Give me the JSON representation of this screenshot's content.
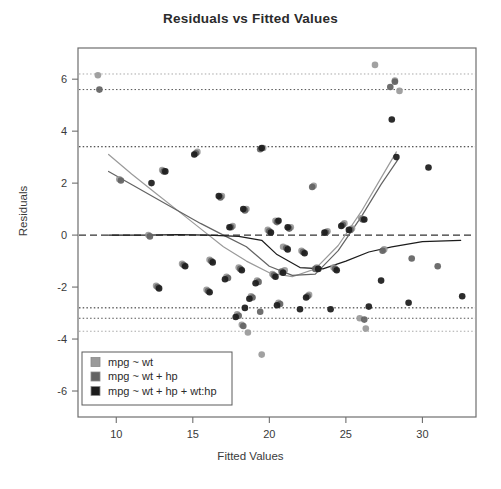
{
  "chart_data": {
    "type": "scatter",
    "title": "Residuals vs Fitted Values",
    "xlabel": "Fitted Values",
    "ylabel": "Residuals",
    "xlim": [
      7.5,
      33.5
    ],
    "ylim": [
      -7.0,
      7.2
    ],
    "xticks": [
      10,
      15,
      20,
      25,
      30
    ],
    "yticks": [
      -6,
      -4,
      -2,
      0,
      2,
      4,
      6
    ],
    "grid": false,
    "legend_position": "bottom-left",
    "zero_line": {
      "y": 0,
      "style": "dashed",
      "color": "#333333"
    },
    "reference_lines": [
      {
        "y": 6.2,
        "style": "dotted",
        "color": "#a8a8a8",
        "series": "mpg ~ wt"
      },
      {
        "y": 5.6,
        "style": "dotted",
        "color": "#555555",
        "series": "mpg ~ wt + hp"
      },
      {
        "y": 3.4,
        "style": "dotted",
        "color": "#222222",
        "series": "mpg ~ wt + hp + wt:hp"
      },
      {
        "y": -2.8,
        "style": "dotted",
        "color": "#222222",
        "series": "mpg ~ wt + hp + wt:hp"
      },
      {
        "y": -3.2,
        "style": "dotted",
        "color": "#555555",
        "series": "mpg ~ wt + hp"
      },
      {
        "y": -3.7,
        "style": "dotted",
        "color": "#a8a8a8",
        "series": "mpg ~ wt"
      }
    ],
    "series": [
      {
        "name": "mpg ~ wt",
        "color": "#9a9a9a",
        "points": [
          [
            8.8,
            6.15
          ],
          [
            26.9,
            6.55
          ],
          [
            28.2,
            5.95
          ],
          [
            28.5,
            5.55
          ],
          [
            19.6,
            3.35
          ],
          [
            15.3,
            3.2
          ],
          [
            10.2,
            2.15
          ],
          [
            22.9,
            1.9
          ],
          [
            13.0,
            2.5
          ],
          [
            16.9,
            1.5
          ],
          [
            18.5,
            1.0
          ],
          [
            20.4,
            0.55
          ],
          [
            21.4,
            0.3
          ],
          [
            23.8,
            0.15
          ],
          [
            25.4,
            0.25
          ],
          [
            26.0,
            0.65
          ],
          [
            12.1,
            0.0
          ],
          [
            24.9,
            0.45
          ],
          [
            17.6,
            0.35
          ],
          [
            19.9,
            0.2
          ],
          [
            20.9,
            -0.45
          ],
          [
            22.1,
            -0.6
          ],
          [
            16.1,
            -0.95
          ],
          [
            18.0,
            -1.25
          ],
          [
            21.0,
            -1.35
          ],
          [
            23.1,
            -1.25
          ],
          [
            17.2,
            -1.6
          ],
          [
            19.2,
            -1.75
          ],
          [
            20.2,
            -1.5
          ],
          [
            24.2,
            -1.25
          ],
          [
            27.5,
            -0.55
          ],
          [
            15.9,
            -2.1
          ],
          [
            18.8,
            -2.35
          ],
          [
            20.6,
            -2.6
          ],
          [
            22.6,
            -2.3
          ],
          [
            17.9,
            -3.05
          ],
          [
            18.2,
            -3.45
          ],
          [
            18.6,
            -3.75
          ],
          [
            19.5,
            -4.6
          ],
          [
            26.3,
            -3.6
          ],
          [
            25.9,
            -3.2
          ],
          [
            12.6,
            -1.95
          ],
          [
            14.3,
            -1.1
          ]
        ]
      },
      {
        "name": "mpg ~ wt + hp",
        "color": "#636363",
        "points": [
          [
            8.9,
            5.6
          ],
          [
            28.2,
            5.9
          ],
          [
            27.9,
            5.7
          ],
          [
            19.4,
            3.3
          ],
          [
            15.2,
            3.15
          ],
          [
            10.3,
            2.1
          ],
          [
            22.8,
            1.85
          ],
          [
            13.1,
            2.45
          ],
          [
            16.8,
            1.45
          ],
          [
            18.4,
            0.95
          ],
          [
            20.5,
            0.5
          ],
          [
            21.3,
            0.25
          ],
          [
            23.7,
            0.1
          ],
          [
            25.3,
            0.2
          ],
          [
            26.1,
            0.6
          ],
          [
            12.2,
            -0.05
          ],
          [
            24.8,
            0.4
          ],
          [
            17.5,
            0.3
          ],
          [
            20.0,
            0.15
          ],
          [
            21.1,
            -0.5
          ],
          [
            22.2,
            -0.65
          ],
          [
            16.2,
            -1.0
          ],
          [
            18.1,
            -1.3
          ],
          [
            20.8,
            -1.4
          ],
          [
            23.0,
            -1.3
          ],
          [
            17.3,
            -1.65
          ],
          [
            19.3,
            -1.8
          ],
          [
            20.3,
            -1.55
          ],
          [
            24.3,
            -1.3
          ],
          [
            27.4,
            -0.6
          ],
          [
            16.0,
            -2.15
          ],
          [
            18.9,
            -2.4
          ],
          [
            20.7,
            -2.65
          ],
          [
            22.5,
            -2.35
          ],
          [
            18.0,
            -3.1
          ],
          [
            18.3,
            -3.5
          ],
          [
            19.4,
            -2.95
          ],
          [
            26.2,
            -3.25
          ],
          [
            12.7,
            -2.0
          ],
          [
            14.4,
            -1.15
          ],
          [
            29.3,
            -0.9
          ],
          [
            31.0,
            -1.2
          ]
        ]
      },
      {
        "name": "mpg ~ wt + hp + wt:hp",
        "color": "#1c1c1c",
        "points": [
          [
            28.0,
            4.45
          ],
          [
            28.3,
            3.0
          ],
          [
            30.4,
            2.6
          ],
          [
            19.5,
            3.35
          ],
          [
            15.1,
            3.1
          ],
          [
            13.2,
            2.45
          ],
          [
            12.3,
            2.0
          ],
          [
            16.7,
            1.5
          ],
          [
            18.3,
            1.0
          ],
          [
            20.6,
            0.55
          ],
          [
            21.2,
            0.3
          ],
          [
            23.6,
            0.1
          ],
          [
            25.2,
            0.2
          ],
          [
            26.2,
            0.6
          ],
          [
            24.7,
            0.35
          ],
          [
            17.4,
            0.3
          ],
          [
            20.1,
            0.1
          ],
          [
            21.2,
            -0.55
          ],
          [
            22.3,
            -0.7
          ],
          [
            16.3,
            -1.05
          ],
          [
            18.2,
            -1.35
          ],
          [
            20.9,
            -1.45
          ],
          [
            23.2,
            -1.3
          ],
          [
            17.1,
            -1.7
          ],
          [
            19.1,
            -1.85
          ],
          [
            20.4,
            -1.6
          ],
          [
            24.4,
            -1.35
          ],
          [
            27.3,
            -1.75
          ],
          [
            16.1,
            -2.2
          ],
          [
            18.7,
            -2.45
          ],
          [
            20.5,
            -2.7
          ],
          [
            22.4,
            -2.4
          ],
          [
            17.8,
            -3.15
          ],
          [
            18.4,
            -2.8
          ],
          [
            22.0,
            -2.85
          ],
          [
            24.0,
            -2.85
          ],
          [
            29.1,
            -2.6
          ],
          [
            32.6,
            -2.35
          ],
          [
            12.8,
            -2.05
          ],
          [
            14.5,
            -1.2
          ],
          [
            26.5,
            -2.75
          ]
        ]
      }
    ],
    "smoothers": [
      {
        "series": "mpg ~ wt",
        "color": "#9a9a9a",
        "points": [
          [
            9.5,
            3.1
          ],
          [
            11.0,
            2.35
          ],
          [
            12.5,
            1.65
          ],
          [
            14.0,
            0.95
          ],
          [
            15.5,
            0.25
          ],
          [
            17.0,
            -0.45
          ],
          [
            18.5,
            -1.0
          ],
          [
            20.0,
            -1.45
          ],
          [
            21.5,
            -1.6
          ],
          [
            23.0,
            -1.3
          ],
          [
            24.5,
            -0.4
          ],
          [
            26.0,
            0.9
          ],
          [
            27.3,
            2.2
          ],
          [
            28.3,
            3.2
          ]
        ]
      },
      {
        "series": "mpg ~ wt + hp",
        "color": "#636363",
        "points": [
          [
            9.5,
            2.45
          ],
          [
            11.0,
            1.95
          ],
          [
            12.5,
            1.45
          ],
          [
            14.0,
            0.95
          ],
          [
            15.5,
            0.45
          ],
          [
            17.0,
            0.0
          ],
          [
            18.5,
            -0.45
          ],
          [
            20.0,
            -1.2
          ],
          [
            21.5,
            -1.55
          ],
          [
            23.0,
            -1.5
          ],
          [
            24.5,
            -0.6
          ],
          [
            26.0,
            0.7
          ],
          [
            27.3,
            1.95
          ],
          [
            28.4,
            2.9
          ]
        ]
      },
      {
        "series": "mpg ~ wt + hp + wt:hp",
        "color": "#1c1c1c",
        "points": [
          [
            9.5,
            0.0
          ],
          [
            12.0,
            0.0
          ],
          [
            14.0,
            0.02
          ],
          [
            16.0,
            0.0
          ],
          [
            18.0,
            -0.05
          ],
          [
            19.5,
            -0.2
          ],
          [
            20.5,
            -0.75
          ],
          [
            22.0,
            -1.25
          ],
          [
            23.5,
            -1.3
          ],
          [
            25.0,
            -1.0
          ],
          [
            26.5,
            -0.65
          ],
          [
            28.0,
            -0.45
          ],
          [
            30.0,
            -0.25
          ],
          [
            32.5,
            -0.2
          ]
        ]
      }
    ],
    "legend": {
      "entries": [
        {
          "label": "mpg ~ wt",
          "color": "#9a9a9a"
        },
        {
          "label": "mpg ~ wt + hp",
          "color": "#636363"
        },
        {
          "label": "mpg ~ wt + hp + wt:hp",
          "color": "#1c1c1c"
        }
      ]
    }
  }
}
